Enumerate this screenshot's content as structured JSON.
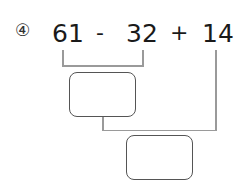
{
  "problem": {
    "index_marker": "④",
    "operand1": "61",
    "operator1": "-",
    "operand2": "32",
    "operator2": "+",
    "operand3": "14"
  },
  "answer_boxes": [
    {
      "label": "intermediate-result",
      "value": ""
    },
    {
      "label": "final-result",
      "value": ""
    }
  ],
  "colors": {
    "text": "#1a1a1a",
    "connector_line": "#9a9a9a",
    "box_border": "#555555"
  }
}
